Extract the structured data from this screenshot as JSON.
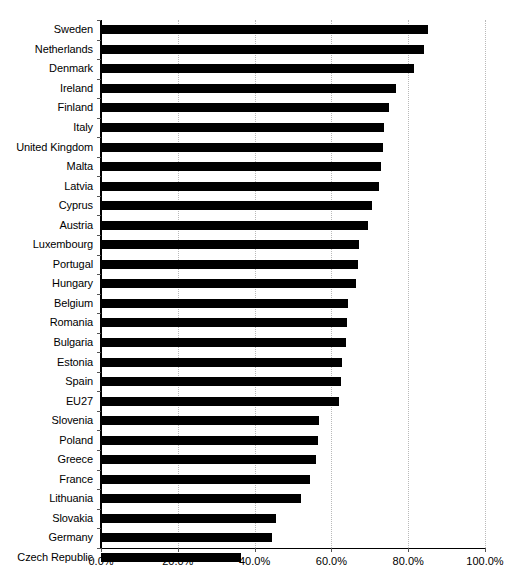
{
  "chart_data": {
    "type": "bar",
    "orientation": "horizontal",
    "title": "",
    "subtitle": "",
    "xlabel": "",
    "ylabel": "",
    "xlim": [
      0,
      100
    ],
    "xtick_values": [
      0,
      20,
      40,
      60,
      80,
      100
    ],
    "xtick_labels": [
      "0.0%",
      "20.0%",
      "40.0%",
      "60.0%",
      "80.0%",
      "100.0%"
    ],
    "grid": "vertical-dotted",
    "legend": "none",
    "bar_color": "#000000",
    "unit": "%",
    "categories": [
      "Sweden",
      "Netherlands",
      "Denmark",
      "Ireland",
      "Finland",
      "Italy",
      "United Kingdom",
      "Malta",
      "Latvia",
      "Cyprus",
      "Austria",
      "Luxembourg",
      "Portugal",
      "Hungary",
      "Belgium",
      "Romania",
      "Bulgaria",
      "Estonia",
      "Spain",
      "EU27",
      "Slovenia",
      "Poland",
      "Greece",
      "France",
      "Lithuania",
      "Slovakia",
      "Germany",
      "Czech Republic"
    ],
    "values": [
      85.2,
      84.2,
      81.5,
      76.8,
      75.0,
      73.8,
      73.4,
      72.9,
      72.4,
      70.5,
      69.6,
      67.2,
      67.0,
      66.4,
      64.4,
      64.0,
      63.8,
      62.8,
      62.5,
      62.0,
      56.8,
      56.4,
      56.0,
      54.4,
      52.0,
      45.5,
      44.5,
      36.5
    ]
  }
}
